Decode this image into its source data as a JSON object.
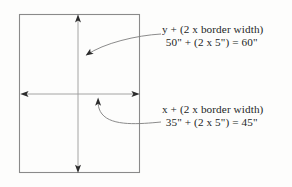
{
  "diagram": {
    "background_color": "#fdfdfc",
    "line_color": "#8a8a8a",
    "arrow_color": "#6f6f6f",
    "text_color": "#231f1e",
    "shapes": {
      "panel_rect": {
        "name": "panel-rectangle",
        "x": 19,
        "y": 14,
        "width": 121,
        "height": 159,
        "stroke": "#8a8a8a",
        "fill": "none"
      },
      "vertical_dimension_arrow": {
        "name": "vertical-dimension-arrow",
        "x": 78,
        "y_top": 15,
        "y_bottom": 172,
        "double_headed": true
      },
      "horizontal_dimension_arrow": {
        "name": "horizontal-dimension-arrow",
        "y": 94,
        "x_left": 21,
        "x_right": 139,
        "double_headed": true
      },
      "leader_curve_y": {
        "name": "leader-curve-y",
        "from": [
          161,
          34
        ],
        "to": [
          80,
          59
        ]
      },
      "leader_curve_x": {
        "name": "leader-curve-x",
        "from": [
          161,
          122
        ],
        "to": [
          98,
          99
        ]
      }
    }
  },
  "callouts": {
    "y_label": {
      "name": "y-dimension-callout",
      "line1": "y + (2 x border width)",
      "line2": "50\" + (2 x 5\") = 60\""
    },
    "x_label": {
      "name": "x-dimension-callout",
      "line1": "x + (2 x border width)",
      "line2": "35\" + (2 x 5\") = 45\""
    }
  }
}
